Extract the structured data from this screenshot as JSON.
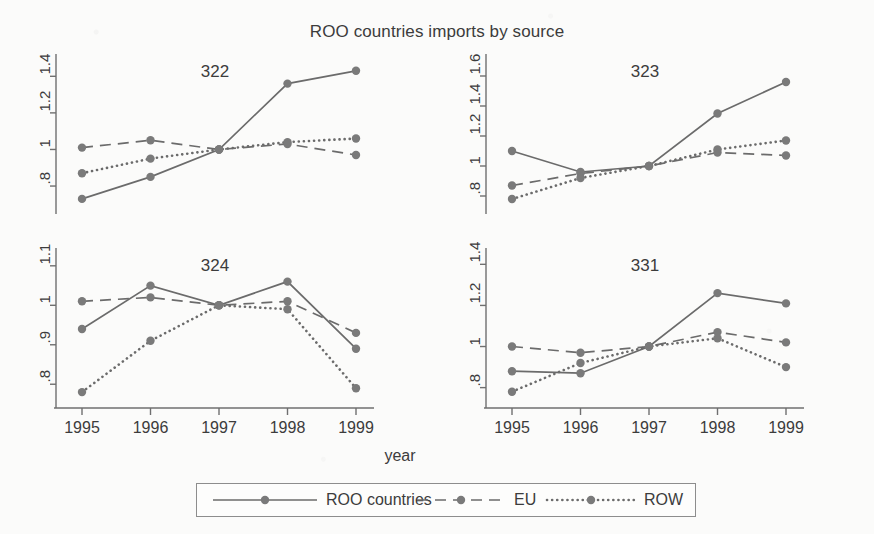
{
  "chart_data": {
    "type": "line",
    "title": "ROO countries imports by source",
    "xlabel": "year",
    "ylabel": "",
    "grid": false,
    "legend_position": "bottom",
    "x": [
      1995,
      1996,
      1997,
      1998,
      1999
    ],
    "xticklabels": [
      "1995",
      "1996",
      "1997",
      "1998",
      "1999"
    ],
    "legend": [
      {
        "name": "ROO countries",
        "style": "solid"
      },
      {
        "name": "EU",
        "style": "dashed"
      },
      {
        "name": "ROW",
        "style": "dotted"
      }
    ],
    "panels": [
      {
        "label": "322",
        "ylim": [
          0.68,
          1.5
        ],
        "yticks": [
          0.8,
          1.0,
          1.2,
          1.4
        ],
        "yticklabels": [
          ".8",
          "1",
          "1.2",
          "1.4"
        ],
        "series": [
          {
            "name": "ROO countries",
            "style": "solid",
            "values": [
              0.73,
              0.85,
              1.0,
              1.36,
              1.43
            ]
          },
          {
            "name": "EU",
            "style": "dashed",
            "values": [
              1.01,
              1.05,
              1.0,
              1.03,
              0.97
            ]
          },
          {
            "name": "ROW",
            "style": "dotted",
            "values": [
              0.87,
              0.95,
              1.0,
              1.04,
              1.06
            ]
          }
        ]
      },
      {
        "label": "323",
        "ylim": [
          0.72,
          1.72
        ],
        "yticks": [
          0.8,
          1.0,
          1.2,
          1.4,
          1.6
        ],
        "yticklabels": [
          ".8",
          "1",
          "1.2",
          "1.4",
          "1.6"
        ],
        "series": [
          {
            "name": "ROO countries",
            "style": "solid",
            "values": [
              1.1,
              0.96,
              1.0,
              1.35,
              1.56
            ]
          },
          {
            "name": "EU",
            "style": "dashed",
            "values": [
              0.87,
              0.95,
              1.0,
              1.09,
              1.07
            ]
          },
          {
            "name": "ROW",
            "style": "dotted",
            "values": [
              0.78,
              0.92,
              1.0,
              1.11,
              1.17
            ]
          }
        ]
      },
      {
        "label": "324",
        "ylim": [
          0.755,
          1.135
        ],
        "yticks": [
          0.8,
          0.9,
          1.0,
          1.1
        ],
        "yticklabels": [
          ".8",
          ".9",
          "1",
          "1.1"
        ],
        "series": [
          {
            "name": "ROO countries",
            "style": "solid",
            "values": [
              0.94,
              1.05,
              1.0,
              1.06,
              0.89
            ]
          },
          {
            "name": "EU",
            "style": "dashed",
            "values": [
              1.01,
              1.02,
              1.0,
              1.01,
              0.93
            ]
          },
          {
            "name": "ROW",
            "style": "dotted",
            "values": [
              0.78,
              0.91,
              1.0,
              0.99,
              0.79
            ]
          }
        ]
      },
      {
        "label": "331",
        "ylim": [
          0.73,
          1.46
        ],
        "yticks": [
          0.8,
          1.0,
          1.2,
          1.4
        ],
        "yticklabels": [
          ".8",
          "1",
          "1.2",
          "1.4"
        ],
        "series": [
          {
            "name": "ROO countries",
            "style": "solid",
            "values": [
              0.88,
              0.87,
              1.0,
              1.26,
              1.21
            ]
          },
          {
            "name": "EU",
            "style": "dashed",
            "values": [
              1.0,
              0.97,
              1.0,
              1.07,
              1.02
            ]
          },
          {
            "name": "ROW",
            "style": "dotted",
            "values": [
              0.78,
              0.92,
              1.0,
              1.04,
              0.9
            ]
          }
        ]
      }
    ],
    "colors": {
      "line": "#6b6b6b",
      "marker": "#7a7a7a",
      "axis": "#6f6f6f",
      "text": "#3c3c3c"
    }
  }
}
